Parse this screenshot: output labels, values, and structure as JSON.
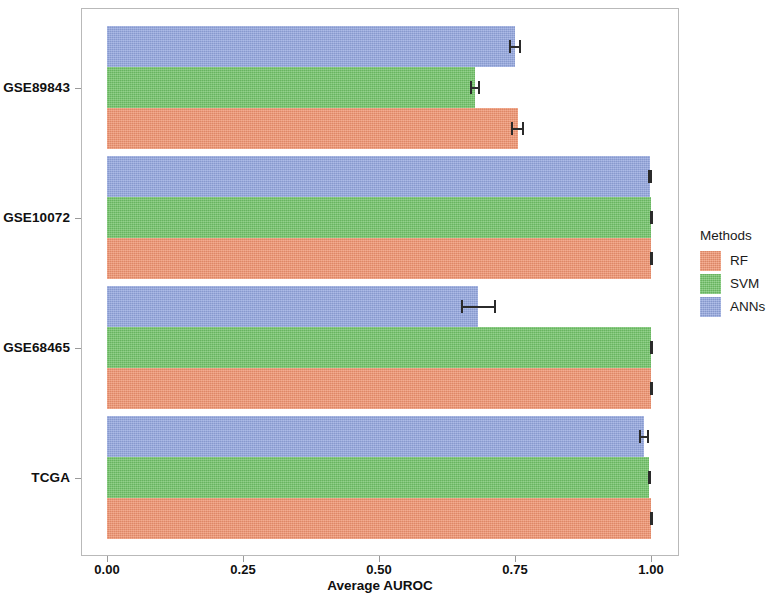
{
  "chart_data": {
    "type": "bar",
    "orientation": "horizontal",
    "title": "",
    "xlabel": "Average AUROC",
    "ylabel": "",
    "xlim": [
      0.0,
      1.1
    ],
    "xticks": [
      "0.00",
      "0.25",
      "0.50",
      "0.75",
      "1.00"
    ],
    "xtick_values": [
      0.0,
      0.25,
      0.5,
      0.75,
      1.0
    ],
    "categories": [
      "GSE89843",
      "GSE10072",
      "GSE68465",
      "TCGA"
    ],
    "grid": false,
    "legend_position": "right",
    "legend_title": "Methods",
    "series": [
      {
        "name": "RF",
        "color": "#f0936f",
        "values": [
          0.755,
          1.0,
          1.0,
          1.0
        ],
        "errors": [
          0.012,
          0.002,
          0.002,
          0.002
        ]
      },
      {
        "name": "SVM",
        "color": "#71c368",
        "values": [
          0.676,
          1.0,
          1.0,
          0.997
        ],
        "errors": [
          0.009,
          0.002,
          0.002,
          0.002
        ]
      },
      {
        "name": "ANNs",
        "color": "#93a6df",
        "values": [
          0.75,
          0.999,
          0.682,
          0.987
        ],
        "errors": [
          0.011,
          0.004,
          0.032,
          0.009
        ]
      }
    ]
  },
  "axes": {
    "x_axis_title": "Average AUROC",
    "x_tick_labels": [
      "0.00",
      "0.25",
      "0.50",
      "0.75",
      "1.00"
    ],
    "y_tick_labels": [
      "GSE89843",
      "GSE10072",
      "GSE68465",
      "TCGA"
    ]
  },
  "legend": {
    "title": "Methods",
    "entries": [
      {
        "label": "RF",
        "color": "#f0936f"
      },
      {
        "label": "SVM",
        "color": "#71c368"
      },
      {
        "label": "ANNs",
        "color": "#93a6df"
      }
    ]
  }
}
